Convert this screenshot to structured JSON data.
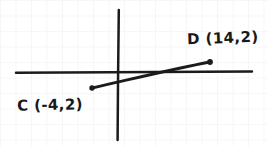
{
  "figure": {
    "kind": "hand-drawn-coordinate-plane",
    "background_color": "#ffffff",
    "ink_color": "#1b1b1d",
    "grid_color": "#eceef1",
    "grid_spacing_px": 15.5,
    "axes": {
      "x_axis": {
        "name": "x-axis",
        "x1": 16,
        "y1": 72.5,
        "x2": 252,
        "y2": 71.5,
        "stroke_width": 2.4
      },
      "y_axis": {
        "name": "y-axis",
        "x1": 118.5,
        "y1": 10,
        "x2": 117.5,
        "y2": 140,
        "stroke_width": 2.4
      },
      "origin_px": {
        "x": 118,
        "y": 72
      }
    },
    "segment": {
      "name": "segment-CD",
      "from": {
        "x": 92,
        "y": 88
      },
      "to": {
        "x": 210,
        "y": 62
      },
      "stroke_width": 2.8
    },
    "points": [
      {
        "id": "C",
        "label": "C (-4,2)",
        "px": {
          "x": 92,
          "y": 88
        },
        "radius": 2.6
      },
      {
        "id": "D",
        "label": "D (14,2)",
        "px": {
          "x": 210,
          "y": 62
        },
        "radius": 2.8
      }
    ]
  },
  "labels": {
    "point_c": "C (-4,2)",
    "point_d": "D (14,2)"
  }
}
